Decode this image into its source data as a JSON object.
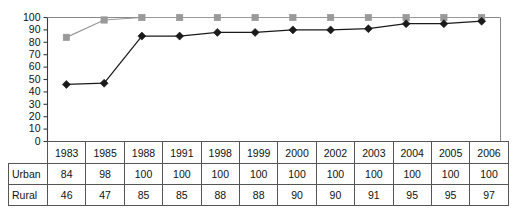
{
  "chart_data": {
    "type": "line",
    "title": "",
    "subtitle": "",
    "xlabel": "",
    "ylabel": "",
    "categories": [
      "1983",
      "1985",
      "1988",
      "1991",
      "1998",
      "1999",
      "2000",
      "2002",
      "2003",
      "2004",
      "2005",
      "2006"
    ],
    "series": [
      {
        "name": "Urban",
        "values": [
          84,
          98,
          100,
          100,
          100,
          100,
          100,
          100,
          100,
          100,
          100,
          100
        ],
        "color": "#999999",
        "marker": "square"
      },
      {
        "name": "Rural",
        "values": [
          46,
          47,
          85,
          85,
          88,
          88,
          90,
          90,
          91,
          95,
          95,
          97
        ],
        "color": "#1a1a1a",
        "marker": "diamond"
      }
    ],
    "ylim": [
      0,
      100
    ],
    "ytick_labels": [
      "100",
      "90",
      "80",
      "70",
      "60",
      "50",
      "40",
      "30",
      "20",
      "10",
      "0"
    ],
    "ytick_values": [
      100,
      90,
      80,
      70,
      60,
      50,
      40,
      30,
      20,
      10,
      0
    ],
    "grid": false,
    "legend_position": "none",
    "plot_border_color": "#888888"
  },
  "table": {
    "corner_label": "",
    "header": [
      "1983",
      "1985",
      "1988",
      "1991",
      "1998",
      "1999",
      "2000",
      "2002",
      "2003",
      "2004",
      "2005",
      "2006"
    ],
    "rows": [
      {
        "label": "Urban",
        "values": [
          "84",
          "98",
          "100",
          "100",
          "100",
          "100",
          "100",
          "100",
          "100",
          "100",
          "100",
          "100"
        ]
      },
      {
        "label": "Rural",
        "values": [
          "46",
          "47",
          "85",
          "85",
          "88",
          "88",
          "90",
          "90",
          "91",
          "95",
          "95",
          "97"
        ]
      }
    ]
  }
}
